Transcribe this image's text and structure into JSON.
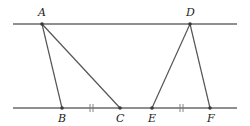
{
  "diagram": {
    "lines": {
      "top": {
        "x1": 13,
        "y": 24,
        "x2": 237
      },
      "bottom": {
        "x1": 13,
        "y": 108,
        "x2": 237
      }
    },
    "points": {
      "A": {
        "label": "A",
        "x": 42,
        "y": 24
      },
      "D": {
        "label": "D",
        "x": 190,
        "y": 24
      },
      "B": {
        "label": "B",
        "x": 62,
        "y": 108
      },
      "C": {
        "label": "C",
        "x": 120,
        "y": 108
      },
      "E": {
        "label": "E",
        "x": 152,
        "y": 108
      },
      "F": {
        "label": "F",
        "x": 210,
        "y": 108
      }
    },
    "segments": [
      [
        "A",
        "B"
      ],
      [
        "A",
        "C"
      ],
      [
        "D",
        "E"
      ],
      [
        "D",
        "F"
      ]
    ],
    "equal_marks": [
      {
        "between": [
          "B",
          "C"
        ],
        "x": 91,
        "count": 2
      },
      {
        "between": [
          "E",
          "F"
        ],
        "x": 181,
        "count": 2
      }
    ],
    "labels": {
      "A": "A",
      "B": "B",
      "C": "C",
      "D": "D",
      "E": "E",
      "F": "F"
    }
  }
}
